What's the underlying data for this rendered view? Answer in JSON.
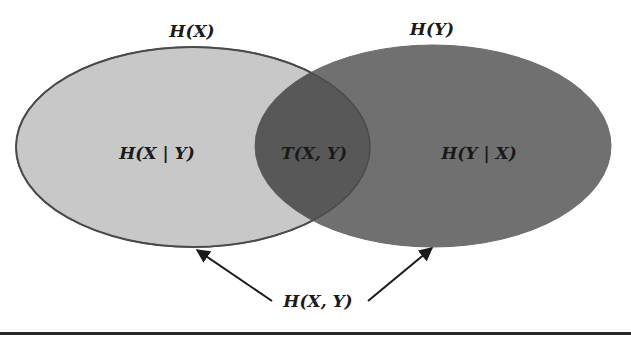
{
  "diagram": {
    "type": "venn",
    "title": "",
    "sets": [
      {
        "id": "X",
        "top_label": "H(X)",
        "exclusive_label": "H(X | Y)",
        "fill": "#c8c8c8",
        "stroke": "#555555"
      },
      {
        "id": "Y",
        "top_label": "H(Y)",
        "exclusive_label": "H(Y | X)",
        "fill": "#6e6e6e",
        "stroke": "#555555"
      }
    ],
    "intersection": {
      "label": "T(X, Y)",
      "fill": "#5a5a5a"
    },
    "union": {
      "label": "H(X, Y)",
      "arrows": 2
    },
    "colors": {
      "background": "#ffffff",
      "text": "#1a1a1a",
      "arrow": "#1a1a1a",
      "rule": "#2a2a2a"
    }
  }
}
